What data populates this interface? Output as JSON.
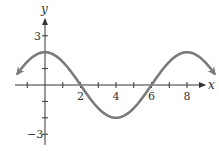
{
  "chart_data": {
    "type": "line",
    "title": "",
    "xlabel": "x",
    "ylabel": "y",
    "function": "y = 2cos(pi*x/4)",
    "xlim": [
      -1.6,
      9.6
    ],
    "ylim": [
      -3.5,
      3.5
    ],
    "x_ticks": [
      -1,
      1,
      2,
      3,
      4,
      5,
      6,
      7,
      8
    ],
    "x_tick_labels": {
      "2": "2",
      "4": "4",
      "6": "6",
      "8": "8"
    },
    "y_ticks": [
      -3,
      -2,
      -1,
      1,
      2,
      3
    ],
    "y_tick_labels": {
      "3": "3",
      "-3": "−3"
    },
    "grid": false,
    "series": [
      {
        "name": "curve",
        "color": "#7a7a7a",
        "x": [
          -1.5,
          -1,
          0,
          1,
          2,
          3,
          4,
          5,
          6,
          7,
          8,
          9,
          9.5
        ],
        "y": [
          1.11,
          1.41,
          2,
          1.41,
          0,
          -1.41,
          -2,
          -1.41,
          0,
          1.41,
          2,
          1.41,
          0.77
        ]
      }
    ]
  },
  "labels": {
    "x_axis": "x",
    "y_axis": "y",
    "tick_2": "2",
    "tick_4": "4",
    "tick_6": "6",
    "tick_8": "8",
    "tick_y3": "3",
    "tick_ym3": "−3"
  }
}
